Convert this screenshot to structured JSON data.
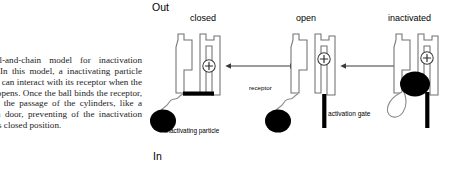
{
  "caption": {
    "text": "The ball-and-chain model for inactivation process. In this model, a inactivating particle (the ball) can interact with its receptor when the channel opens. Once the ball binds the receptor, it blocks the passage of the cylinders, like a foot in a door, preventing of the inactivation gate to its closed position."
  },
  "diagram": {
    "type": "ion-channel-ball-and-chain-model",
    "orientation_labels": {
      "outside": "Out",
      "inside": "In"
    },
    "states": [
      {
        "id": "closed",
        "label": "closed",
        "gate": "closed",
        "voltage_sensor": "+",
        "ball_position": "outside-channel-below",
        "annotations": [
          "inactivating particle"
        ]
      },
      {
        "id": "open",
        "label": "open",
        "gate": "open",
        "voltage_sensor": "+",
        "ball_position": "outside-channel-below",
        "annotations": [
          "receptor",
          "activation gate"
        ]
      },
      {
        "id": "inactivated",
        "label": "inactivated",
        "gate": "open",
        "voltage_sensor": "+",
        "ball_position": "blocking-pore",
        "annotations": []
      }
    ],
    "annotations": {
      "inactivating_particle": "inactivating particle",
      "activation_gate": "activation gate",
      "receptor": "receptor",
      "voltage_sensor_charge": "+"
    },
    "transitions": [
      {
        "from": "closed",
        "to": "open",
        "arrow": "double-headed"
      },
      {
        "from": "open",
        "to": "inactivated",
        "arrow": "double-headed"
      }
    ],
    "colors": {
      "ball": "#000000",
      "gate_bar": "#000000",
      "channel_outline": "#6e6e6e",
      "background": "#ffffff"
    }
  }
}
